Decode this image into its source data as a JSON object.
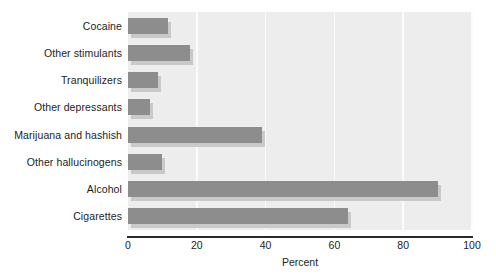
{
  "chart_data": {
    "type": "bar",
    "orientation": "horizontal",
    "title": "",
    "subtitle": "",
    "xlabel": "Percent",
    "ylabel": "",
    "xlim": [
      0,
      100
    ],
    "xticks": [
      0,
      20,
      40,
      60,
      80,
      100
    ],
    "xtick_labels": [
      "0",
      "20",
      "40",
      "60",
      "80",
      "100"
    ],
    "grid": true,
    "grid_axis": "x",
    "legend": false,
    "legend_position": "none",
    "categories": [
      "Cocaine",
      "Other stimulants",
      "Tranquilizers",
      "Other depressants",
      "Marijuana and hashish",
      "Other hallucinogens",
      "Alcohol",
      "Cigarettes"
    ],
    "values": [
      11.5,
      18,
      8.7,
      6.4,
      39,
      10,
      90,
      64
    ],
    "series": [
      {
        "name": "Percent",
        "values": [
          11.5,
          18,
          8.7,
          6.4,
          39,
          10,
          90,
          64
        ]
      }
    ],
    "colors": {
      "bar": "#8d8d8d",
      "bar_shadow": "#c9c9c9",
      "plot_background": "#ededed",
      "gridline": "#fbfbfb",
      "axis_line": "#2b2b2b",
      "text": "#1c1c1c",
      "page_background": "#ffffff"
    }
  }
}
